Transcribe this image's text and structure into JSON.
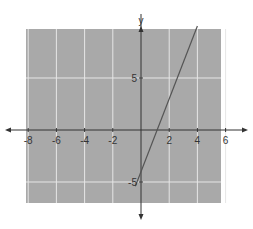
{
  "chart_data": {
    "type": "line",
    "title": "",
    "xlabel": "",
    "ylabel": "y",
    "xlim": [
      -8,
      6
    ],
    "ylim": [
      -6,
      11
    ],
    "x_ticks": [
      -8,
      -6,
      -4,
      -2,
      2,
      4,
      6
    ],
    "x_tick_labels": [
      "-8",
      "-6",
      "-4",
      "-2",
      "2",
      "4",
      "6"
    ],
    "y_ticks": [
      5,
      -5
    ],
    "y_tick_labels": [
      "5",
      "-5"
    ],
    "grid": true,
    "legend": null,
    "series": [
      {
        "name": "line",
        "equation": "y = 3.5x - 4",
        "x": [
          -0.4,
          4.0
        ],
        "y": [
          -5.4,
          10.0
        ],
        "color": "#555555"
      }
    ],
    "colors": {
      "plot_background": "#a9a9a9",
      "grid": "#e6e6e6",
      "axis": "#333333"
    }
  }
}
